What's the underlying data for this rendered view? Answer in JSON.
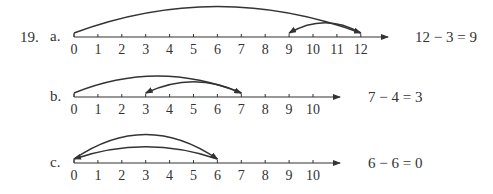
{
  "problem_number": "19.",
  "colors": {
    "ink": "#333333",
    "background": "#ffffff"
  },
  "layout": {
    "x0": 74,
    "spacing": 23.9
  },
  "parts": [
    {
      "label": "a.",
      "axis_y": 37,
      "ticks": [
        "0",
        "1",
        "2",
        "3",
        "4",
        "5",
        "6",
        "7",
        "8",
        "9",
        "10",
        "11",
        "12"
      ],
      "axis_end_x": 388,
      "jumps": [
        {
          "from": 0,
          "to": 12,
          "height": 30,
          "direction": "right"
        },
        {
          "from": 12,
          "to": 9,
          "height": 13,
          "direction": "left"
        }
      ],
      "equation": "12 − 3 = 9"
    },
    {
      "label": "b.",
      "axis_y": 97,
      "ticks": [
        "0",
        "1",
        "2",
        "3",
        "4",
        "5",
        "6",
        "7",
        "8",
        "9",
        "10"
      ],
      "axis_end_x": 340,
      "jumps": [
        {
          "from": 0,
          "to": 7,
          "height": 20,
          "direction": "right"
        },
        {
          "from": 7,
          "to": 3,
          "height": 14,
          "direction": "left"
        }
      ],
      "equation": "7 − 4 = 3"
    },
    {
      "label": "c.",
      "axis_y": 163,
      "ticks": [
        "0",
        "1",
        "2",
        "3",
        "4",
        "5",
        "6",
        "7",
        "8",
        "9",
        "10"
      ],
      "axis_end_x": 340,
      "jumps": [
        {
          "from": 0,
          "to": 6,
          "height": 28,
          "direction": "right"
        },
        {
          "from": 6,
          "to": 0,
          "height": 15,
          "direction": "left"
        }
      ],
      "equation": "6 − 6 = 0"
    }
  ]
}
